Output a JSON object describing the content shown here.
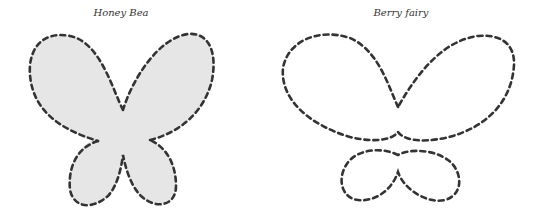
{
  "panels": [
    {
      "title": "Honey Bea",
      "style": "filled",
      "fill_color": "#e6e6e6",
      "stroke_color": "#333333"
    },
    {
      "title": "Berry fairy",
      "style": "outline",
      "fill_color": "none",
      "stroke_color": "#333333"
    }
  ]
}
